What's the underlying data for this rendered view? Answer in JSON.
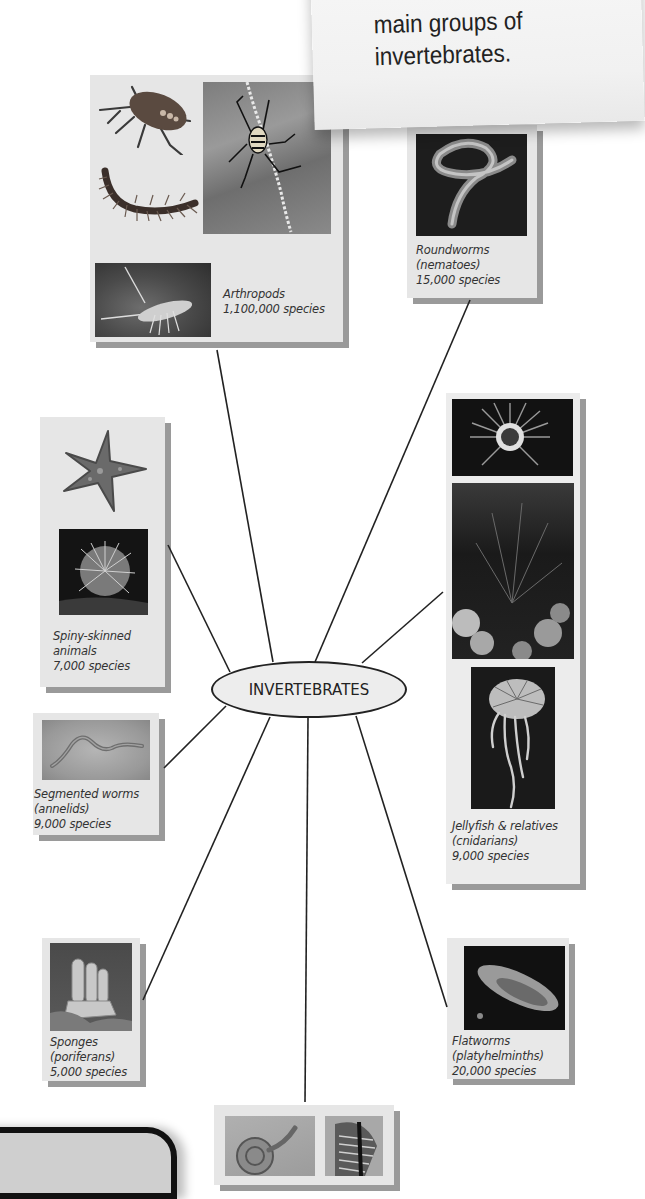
{
  "note": {
    "lines": [
      "main groups of",
      "invertebrates."
    ]
  },
  "hub": {
    "label": "INVERTEBRATES"
  },
  "groups": [
    {
      "id": "arthropods",
      "name": "Arthropods",
      "subtitle": "",
      "species": "1,100,000 species",
      "images": [
        "shield-bug",
        "spider-on-web",
        "centipede",
        "lobster"
      ]
    },
    {
      "id": "roundworms",
      "name": "Roundworms",
      "subtitle": "(nematoes)",
      "species": "15,000 species",
      "images": [
        "nematode"
      ]
    },
    {
      "id": "spiny-skinned",
      "name": "Spiny-skinned",
      "subtitle": "animals",
      "species": "7,000 species",
      "images": [
        "starfish",
        "sea-urchin"
      ]
    },
    {
      "id": "jellyfish",
      "name": "Jellyfish & relatives",
      "subtitle": "(cnidarians)",
      "species": "9,000 species",
      "images": [
        "sea-anemone",
        "coral",
        "jellyfish"
      ]
    },
    {
      "id": "segmented-worms",
      "name": "Segmented worms",
      "subtitle": "(annelids)",
      "species": "9,000 species",
      "images": [
        "earthworm"
      ]
    },
    {
      "id": "sponges",
      "name": "Sponges",
      "subtitle": "(poriferans)",
      "species": "5,000 species",
      "images": [
        "sponge"
      ]
    },
    {
      "id": "flatworms",
      "name": "Flatworms",
      "subtitle": "(platyhelminths)",
      "species": "20,000 species",
      "images": [
        "flatworm"
      ]
    },
    {
      "id": "molluscs",
      "name": "",
      "subtitle": "",
      "species": "",
      "images": [
        "snail",
        "scallop-shell"
      ]
    }
  ],
  "colors": {
    "card": "#e6e6e6",
    "card_shadow": "#9a9a9a",
    "line": "#222222",
    "text": "#333333"
  }
}
